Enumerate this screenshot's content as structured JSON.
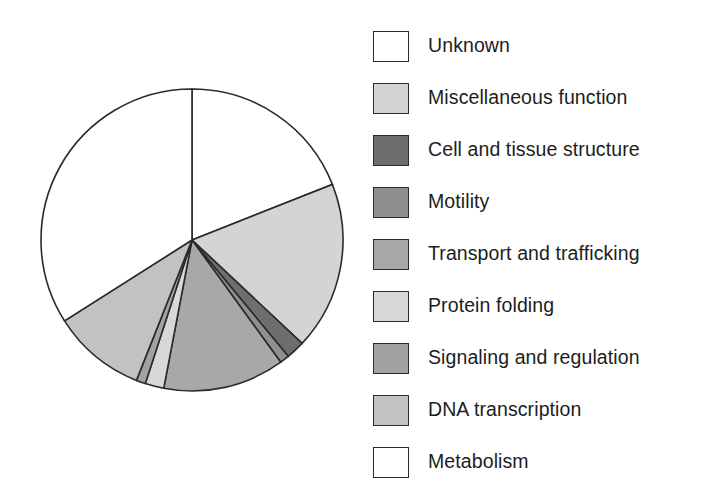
{
  "chart_data": {
    "type": "pie",
    "title": "",
    "subtitle": "",
    "xlabel": "",
    "ylabel": "",
    "grid": false,
    "legend_position": "right",
    "start_angle_deg": 0,
    "direction": "clockwise",
    "center": {
      "x": 192,
      "y": 240
    },
    "radius": 151,
    "categories": [
      "Unknown",
      "Miscellaneous function",
      "Cell and tissue structure",
      "Motility",
      "Transport and trafficking",
      "Protein folding",
      "Signaling and regulation",
      "DNA transcription",
      "Metabolism"
    ],
    "values": [
      19,
      18,
      2,
      1,
      13,
      2,
      1,
      10,
      34
    ],
    "units": "percent",
    "slice_angles_deg": [
      68.4,
      64.8,
      7.2,
      3.6,
      46.8,
      7.2,
      3.6,
      36.0,
      122.4
    ],
    "colors": [
      "#ffffff",
      "#d4d4d4",
      "#6e6e6e",
      "#8f8f8f",
      "#a8a8a8",
      "#d8d8d8",
      "#a2a2a2",
      "#c2c2c2",
      "#ffffff"
    ],
    "stroke_color": "#2b2b2b",
    "series": [
      {
        "name": "Protein categories",
        "values": [
          19,
          18,
          2,
          1,
          13,
          2,
          1,
          10,
          34
        ]
      }
    ]
  },
  "legend": {
    "items": [
      {
        "label": "Unknown",
        "color": "#ffffff",
        "swatch_name": "legend-swatch-unknown"
      },
      {
        "label": "Miscellaneous function",
        "color": "#d4d4d4",
        "swatch_name": "legend-swatch-miscellaneous-function"
      },
      {
        "label": "Cell and tissue structure",
        "color": "#6e6e6e",
        "swatch_name": "legend-swatch-cell-and-tissue-structure"
      },
      {
        "label": "Motility",
        "color": "#8f8f8f",
        "swatch_name": "legend-swatch-motility"
      },
      {
        "label": "Transport and trafficking",
        "color": "#a8a8a8",
        "swatch_name": "legend-swatch-transport-and-trafficking"
      },
      {
        "label": "Protein folding",
        "color": "#d8d8d8",
        "swatch_name": "legend-swatch-protein-folding"
      },
      {
        "label": "Signaling and regulation",
        "color": "#a2a2a2",
        "swatch_name": "legend-swatch-signaling-and-regulation"
      },
      {
        "label": "DNA transcription",
        "color": "#c2c2c2",
        "swatch_name": "legend-swatch-dna-transcription"
      },
      {
        "label": "Metabolism",
        "color": "#ffffff",
        "swatch_name": "legend-swatch-metabolism"
      }
    ]
  }
}
